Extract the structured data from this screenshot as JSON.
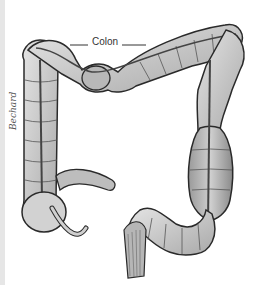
{
  "figure": {
    "label": "Colon",
    "signature": "Bechard",
    "colors": {
      "background": "#ffffff",
      "tissue_light": "#d9d9d9",
      "tissue_mid": "#a8a8a8",
      "tissue_dark": "#6e6e6e",
      "outline": "#2a2a2a"
    }
  }
}
